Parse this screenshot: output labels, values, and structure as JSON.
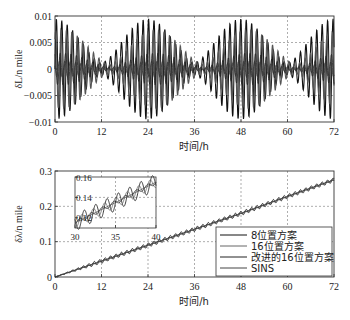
{
  "chart_data": [
    {
      "type": "line",
      "title": "",
      "xlabel": "时间/h",
      "ylabel": "δL/n mile",
      "xlim": [
        0,
        72
      ],
      "ylim": [
        -0.01,
        0.01
      ],
      "xticks": [
        0,
        12,
        24,
        36,
        48,
        60,
        72
      ],
      "xtick_labels": [
        "0",
        "12",
        "24",
        "36",
        "48",
        "60",
        "72"
      ],
      "yticks": [
        -0.01,
        -0.005,
        0,
        0.005,
        0.01
      ],
      "ytick_labels": [
        "-0.01",
        "-0.005",
        "0",
        "0.005",
        "0.01"
      ],
      "grid": true,
      "description": "Latitude error oscillations; dense high-frequency oscillation with ~24h amplitude envelope (max ~±0.01 near 0h, 24-28h, 48h, 72h; minima ~12h, 36-38h, 60h)",
      "series": [
        {
          "name": "8位置方案",
          "envelope_amplitude": 0.0095,
          "envelope_period_h": 24,
          "carrier_period_h": 1.4,
          "color": "#111111"
        },
        {
          "name": "16位置方案",
          "envelope_amplitude": 0.0075,
          "envelope_period_h": 24,
          "carrier_period_h": 1.4,
          "color": "#555555"
        },
        {
          "name": "改进的16位置方案",
          "envelope_amplitude": 0.003,
          "envelope_period_h": 24,
          "carrier_period_h": 1.4,
          "color": "#222222"
        },
        {
          "name": "SINS",
          "envelope_amplitude": 0.0015,
          "envelope_period_h": 24,
          "carrier_period_h": 1.4,
          "color": "#333333"
        }
      ]
    },
    {
      "type": "line",
      "title": "",
      "xlabel": "时间/h",
      "ylabel": "δλ/n mile",
      "xlim": [
        0,
        72
      ],
      "ylim": [
        0,
        0.3
      ],
      "xticks": [
        0,
        12,
        24,
        36,
        48,
        60,
        72
      ],
      "xtick_labels": [
        "0",
        "12",
        "24",
        "36",
        "48",
        "60",
        "72"
      ],
      "yticks": [
        0,
        0.1,
        0.2,
        0.3
      ],
      "ytick_labels": [
        "0",
        "0.1",
        "0.2",
        "0.3"
      ],
      "grid": true,
      "legend_position": "lower right",
      "description": "Longitude error grows approximately linearly from 0 to ~0.275 n mile at 72h, with small oscillations",
      "series": [
        {
          "name": "8位置方案",
          "x": [
            0,
            12,
            24,
            36,
            48,
            60,
            72
          ],
          "values": [
            0,
            0.045,
            0.09,
            0.135,
            0.18,
            0.228,
            0.275
          ],
          "ripple": 0.006
        },
        {
          "name": "16位置方案",
          "x": [
            0,
            12,
            24,
            36,
            48,
            60,
            72
          ],
          "values": [
            0,
            0.045,
            0.09,
            0.135,
            0.18,
            0.228,
            0.275
          ],
          "ripple": 0.004
        },
        {
          "name": "改进的16位置方案",
          "x": [
            0,
            12,
            24,
            36,
            48,
            60,
            72
          ],
          "values": [
            0,
            0.045,
            0.09,
            0.135,
            0.18,
            0.228,
            0.275
          ],
          "ripple": 0.001
        },
        {
          "name": "SINS",
          "x": [
            0,
            12,
            24,
            36,
            48,
            60,
            72
          ],
          "values": [
            0,
            0.045,
            0.09,
            0.135,
            0.18,
            0.228,
            0.275
          ],
          "ripple": 0.0
        }
      ],
      "inset": {
        "xlim": [
          30,
          40
        ],
        "ylim": [
          0.11,
          0.16
        ],
        "xticks": [
          30,
          35,
          40
        ],
        "xtick_labels": [
          "30",
          "35",
          "40"
        ],
        "yticks": [
          0.12,
          0.14,
          0.16
        ],
        "ytick_labels": [
          "0.12",
          "0.14",
          "0.16"
        ],
        "line_start": [
          30,
          0.115
        ],
        "line_end": [
          40,
          0.155
        ],
        "ripple_amplitudes": [
          0.008,
          0.005,
          0.002,
          0.0
        ],
        "ripple_period_h": 1.4
      }
    }
  ],
  "legend": {
    "items": [
      "8位置方案",
      "16位置方案",
      "改进的16位置方案",
      "SINS"
    ]
  }
}
